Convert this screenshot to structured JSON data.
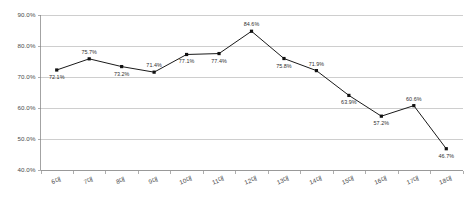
{
  "chart_data": {
    "type": "line",
    "title": "",
    "subtitle": "",
    "xlabel": "",
    "ylabel": "",
    "categories": [
      "6대",
      "7대",
      "8대",
      "9대",
      "10대",
      "11대",
      "12대",
      "13대",
      "14대",
      "15대",
      "16대",
      "17대",
      "18대"
    ],
    "values": [
      72.1,
      75.7,
      73.2,
      71.4,
      77.1,
      77.4,
      84.6,
      75.8,
      71.9,
      63.9,
      57.2,
      60.6,
      46.7
    ],
    "point_labels": [
      "72.1%",
      "75.7%",
      "73.2%",
      "71.4%",
      "77.1%",
      "77.4%",
      "84.6%",
      "75.8%",
      "71.9%",
      "63.9%",
      "57.2%",
      "60.6%",
      "46.7%"
    ],
    "label_positions": [
      "below",
      "above",
      "below",
      "above",
      "below",
      "below",
      "above",
      "below",
      "above",
      "below",
      "below",
      "above",
      "below"
    ],
    "ylim": [
      40.0,
      90.0
    ],
    "ytick_values": [
      40.0,
      50.0,
      60.0,
      70.0,
      80.0,
      90.0
    ],
    "ytick_labels": [
      "40.0%",
      "50.0%",
      "60.0%",
      "70.0%",
      "80.0%",
      "90.0%"
    ],
    "grid": true,
    "grid_axis": "y",
    "legend": false,
    "legend_position": "none",
    "marker": "square",
    "series": [
      {
        "name": "",
        "values": [
          72.1,
          75.7,
          73.2,
          71.4,
          77.1,
          77.4,
          84.6,
          75.8,
          71.9,
          63.9,
          57.2,
          60.6,
          46.7
        ]
      }
    ],
    "colors": {
      "line": "#1a1a1a",
      "marker": "#111111",
      "grid": "#b9b9b9",
      "axis": "#8c8c8c",
      "text": "#3a3a3a",
      "background": "#ffffff"
    }
  }
}
